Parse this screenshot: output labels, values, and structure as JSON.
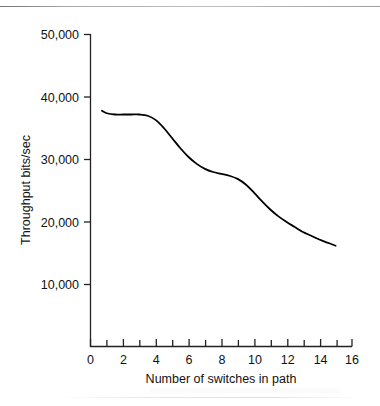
{
  "chart_data": {
    "type": "line",
    "title": "",
    "subtitle": "",
    "xlabel": "Number of switches in path",
    "ylabel": "Throughput bits/sec",
    "xlim": [
      0,
      16
    ],
    "ylim": [
      0,
      50000
    ],
    "grid": false,
    "legend": null,
    "x_ticks": [
      0,
      1,
      2,
      3,
      4,
      5,
      6,
      7,
      8,
      9,
      10,
      11,
      12,
      13,
      14,
      15,
      16
    ],
    "x_tick_labels": [
      "0",
      "",
      "2",
      "",
      "4",
      "",
      "6",
      "",
      "8",
      "",
      "10",
      "",
      "12",
      "",
      "14",
      "",
      "16"
    ],
    "x_major_labels": [
      "0",
      "2",
      "4",
      "6",
      "8",
      "10",
      "12",
      "14",
      "16"
    ],
    "y_ticks": [
      10000,
      20000,
      30000,
      40000,
      50000
    ],
    "y_tick_labels": [
      "10,000",
      "20,000",
      "30,000",
      "40,000",
      "50,000"
    ],
    "series": [
      {
        "name": "Throughput",
        "color": "#000000",
        "line_width": 1.8,
        "x": [
          0.7,
          1.0,
          1.5,
          2.0,
          2.5,
          3.0,
          3.5,
          4.0,
          4.5,
          5.0,
          5.5,
          6.0,
          6.5,
          7.0,
          7.5,
          8.0,
          8.5,
          9.0,
          9.5,
          10.0,
          10.5,
          11.0,
          11.5,
          12.0,
          12.5,
          13.0,
          13.5,
          14.0,
          14.5,
          15.0
        ],
        "values": [
          37800,
          37400,
          37200,
          37200,
          37200,
          37200,
          37000,
          36300,
          35000,
          33400,
          31800,
          30400,
          29300,
          28500,
          28000,
          27700,
          27400,
          26900,
          26000,
          24700,
          23300,
          22000,
          20900,
          20000,
          19200,
          18400,
          17800,
          17200,
          16700,
          16200
        ]
      }
    ]
  },
  "axes": {
    "y_axis_name": "y-axis",
    "x_axis_name": "x-axis"
  }
}
